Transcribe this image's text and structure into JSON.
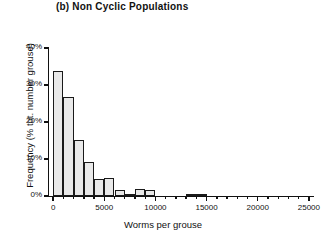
{
  "figure": {
    "panel_label": "(b)",
    "title": "(b) Non Cyclic Populations",
    "xlabel": "Worms per grouse",
    "ylabel": "Frequency (% tot. number grouse)"
  },
  "axes": {
    "y_ticks": [
      "0%",
      "10%",
      "20%",
      "30%",
      "40%"
    ],
    "x_ticks": [
      "0",
      "5000",
      "10000",
      "15000",
      "20000",
      "25000"
    ]
  },
  "chart_data": {
    "type": "bar",
    "title": "(b) Non Cyclic Populations",
    "xlabel": "Worms per grouse",
    "ylabel": "Frequency (% tot. number grouse)",
    "xlim": [
      -500,
      25500
    ],
    "ylim": [
      0,
      40
    ],
    "grid": false,
    "legend": "none",
    "bin_width": 1000,
    "y_tick_values": [
      0,
      10,
      20,
      30,
      40
    ],
    "y_tick_labels": [
      "0%",
      "10%",
      "20%",
      "30%",
      "40%"
    ],
    "x_tick_values": [
      0,
      5000,
      10000,
      15000,
      20000,
      25000
    ],
    "x_tick_labels": [
      "0",
      "5000",
      "10000",
      "15000",
      "20000",
      "25000"
    ],
    "x_minor_tick_step": 1000,
    "categories": [
      250,
      1250,
      2250,
      3250,
      4250,
      5250,
      6250,
      7250,
      8250,
      9250,
      10250,
      11250,
      12250,
      13250,
      14250,
      15250
    ],
    "values": [
      33.8,
      26.7,
      15.2,
      9.2,
      4.6,
      4.8,
      1.6,
      0.2,
      2.0,
      1.7,
      0.0,
      0.0,
      0.0,
      0.6,
      0.6,
      0.0
    ],
    "bars": [
      {
        "bin_start": 0,
        "bin_end": 1000,
        "value": 33.8
      },
      {
        "bin_start": 1000,
        "bin_end": 2000,
        "value": 26.7
      },
      {
        "bin_start": 2000,
        "bin_end": 3000,
        "value": 15.2
      },
      {
        "bin_start": 3000,
        "bin_end": 4000,
        "value": 9.2
      },
      {
        "bin_start": 4000,
        "bin_end": 5000,
        "value": 4.6
      },
      {
        "bin_start": 5000,
        "bin_end": 6000,
        "value": 4.8
      },
      {
        "bin_start": 6000,
        "bin_end": 7000,
        "value": 1.6
      },
      {
        "bin_start": 7000,
        "bin_end": 8000,
        "value": 0.2
      },
      {
        "bin_start": 8000,
        "bin_end": 9000,
        "value": 2.0
      },
      {
        "bin_start": 9000,
        "bin_end": 10000,
        "value": 1.7
      },
      {
        "bin_start": 13000,
        "bin_end": 14000,
        "value": 0.6
      },
      {
        "bin_start": 14000,
        "bin_end": 15000,
        "value": 0.6
      }
    ]
  }
}
